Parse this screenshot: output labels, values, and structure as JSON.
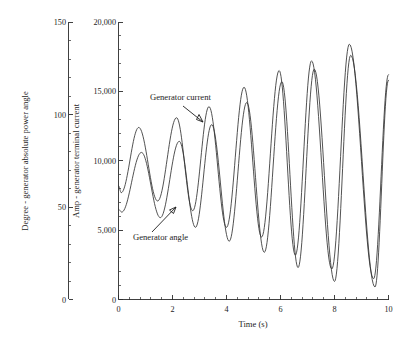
{
  "figure": {
    "background_color": "#ffffff",
    "line_color": "#333333",
    "axis_color": "#2b2b2b"
  },
  "axes": {
    "left_outer": {
      "title": "Degree - generator absolute power angle",
      "ticks": [
        "0",
        "50",
        "100",
        "150"
      ],
      "min": 0,
      "max": 150,
      "minor_per_interval": 5
    },
    "left_inner": {
      "title": "Amp - generator terminal current",
      "ticks": [
        "0",
        "5,000",
        "10,000",
        "15,000",
        "20,000"
      ],
      "min": 0,
      "max": 20000,
      "minor_per_interval": 5
    },
    "bottom": {
      "title": "Time (s)",
      "ticks": [
        "0",
        "2",
        "4",
        "6",
        "8",
        "10"
      ],
      "min": 0,
      "max": 10,
      "minor_per_interval": 5
    }
  },
  "annotations": [
    {
      "label": "Generator current",
      "text_x": 150,
      "text_y": 100
    },
    {
      "label": "Generator angle",
      "text_x": 133,
      "text_y": 240
    }
  ],
  "chart_data": {
    "type": "line",
    "title": "",
    "xlabel": "Time (s)",
    "ylabel": "Amp - generator terminal current",
    "ylabel_secondary": "Degree - generator absolute power angle",
    "xlim": [
      0,
      10
    ],
    "ylim": [
      0,
      20000
    ],
    "ylim_secondary": [
      0,
      150
    ],
    "grid": false,
    "legend": "annotated-inline",
    "x_ticks": [
      0,
      2,
      4,
      6,
      8,
      10
    ],
    "y_ticks": [
      0,
      5000,
      10000,
      15000,
      20000
    ],
    "y_ticks_secondary": [
      0,
      50,
      100,
      150
    ],
    "series": [
      {
        "name": "Generator current",
        "axis": "left_inner",
        "units": "Amp",
        "start_value": 8200,
        "peaks": [
          {
            "t": 0.75,
            "y": 12400
          },
          {
            "t": 2.15,
            "y": 13100
          },
          {
            "t": 3.35,
            "y": 13900
          },
          {
            "t": 4.65,
            "y": 15300
          },
          {
            "t": 5.95,
            "y": 16500
          },
          {
            "t": 7.15,
            "y": 17200
          },
          {
            "t": 8.55,
            "y": 18400
          }
        ],
        "troughs": [
          {
            "t": 0.1,
            "y": 7700
          },
          {
            "t": 1.45,
            "y": 7100
          },
          {
            "t": 2.75,
            "y": 6400
          },
          {
            "t": 4.0,
            "y": 5200
          },
          {
            "t": 5.3,
            "y": 4500
          },
          {
            "t": 6.55,
            "y": 3200
          },
          {
            "t": 7.9,
            "y": 2200
          },
          {
            "t": 9.45,
            "y": 1500
          }
        ],
        "end_value": 16200
      },
      {
        "name": "Generator angle",
        "axis": "left_outer",
        "units": "Degree",
        "start_value": 6500,
        "peaks": [
          {
            "t": 0.85,
            "y": 10600
          },
          {
            "t": 2.25,
            "y": 11400
          },
          {
            "t": 3.45,
            "y": 12600
          },
          {
            "t": 4.75,
            "y": 14200
          },
          {
            "t": 6.05,
            "y": 15700
          },
          {
            "t": 7.25,
            "y": 16600
          },
          {
            "t": 8.6,
            "y": 17600
          }
        ],
        "troughs": [
          {
            "t": 0.12,
            "y": 6300
          },
          {
            "t": 1.55,
            "y": 5900
          },
          {
            "t": 2.85,
            "y": 5200
          },
          {
            "t": 4.1,
            "y": 4200
          },
          {
            "t": 5.4,
            "y": 3400
          },
          {
            "t": 6.65,
            "y": 2300
          },
          {
            "t": 8.0,
            "y": 1300
          },
          {
            "t": 9.5,
            "y": 900
          }
        ],
        "end_value": 15800
      }
    ]
  }
}
